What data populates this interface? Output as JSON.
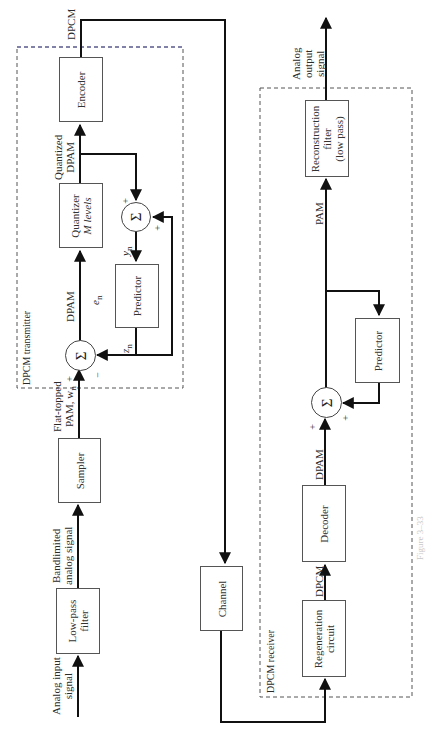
{
  "transmitter": {
    "title": "DPCM transmitter",
    "blocks": {
      "encoder": "Encoder",
      "quantizer_line1": "Quantizer",
      "quantizer_line2": "M levels",
      "predictor": "Predictor",
      "sampler": "Sampler"
    },
    "signals": {
      "dpcm_out": "DPCM",
      "quantized_line1": "Quantized",
      "quantized_line2": "DPAM",
      "dpam": "DPAM",
      "en": "e",
      "en_sub": "n",
      "yn": "y",
      "yn_sub": "n",
      "zn": "z",
      "zn_sub": "n",
      "flat_line1": "Flat-topped",
      "flat_line2": "PAM, w",
      "flat_sub": "n",
      "bandlimited_line1": "Bandlimited",
      "bandlimited_line2": "analog signal"
    },
    "signs": {
      "sum1_plus": "+",
      "sum1_minus": "−",
      "sum2_plus_top": "+",
      "sum2_plus_right": "+"
    }
  },
  "input": {
    "label_line1": "Analog input",
    "label_line2": "signal",
    "lowpass_line1": "Low-pass",
    "lowpass_line2": "filter"
  },
  "channel": {
    "label": "Channel"
  },
  "receiver": {
    "title": "DPCM receiver",
    "blocks": {
      "regeneration_line1": "Regeneration",
      "regeneration_line2": "circuit",
      "decoder": "Decoder",
      "predictor": "Predictor",
      "recon_line1": "Reconstruction",
      "recon_line2": "filter",
      "recon_line3": "(low pass)"
    },
    "signals": {
      "dpcm": "DPCM",
      "dpam": "DPAM",
      "pam": "PAM",
      "output_line1": "Analog",
      "output_line2": "output",
      "output_line3": "signal"
    },
    "signs": {
      "sum_plus_left": "+",
      "sum_plus_right": "+"
    }
  },
  "symbols": {
    "sigma": "Σ"
  },
  "caption": "Figure 3–33"
}
